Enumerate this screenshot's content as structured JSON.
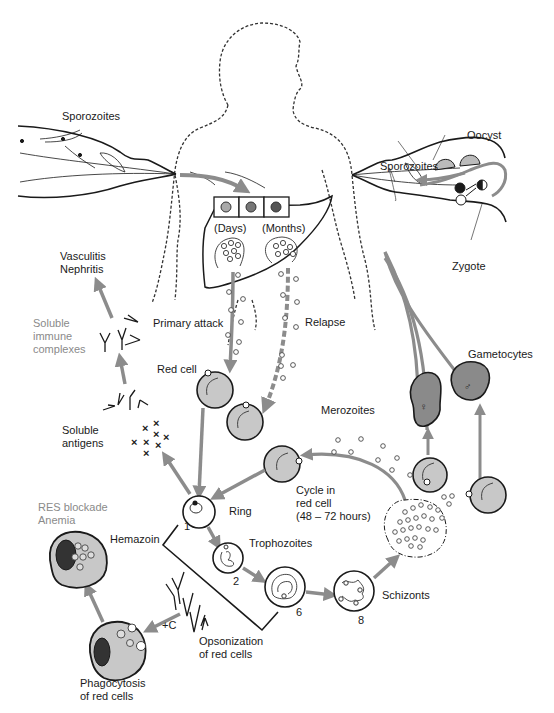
{
  "diagram": {
    "type": "malaria-life-cycle",
    "colors": {
      "arrow": "#8c8c8c",
      "cell_fill": "#c8c8c8",
      "gametocyte_fill": "#8a8a8a",
      "outline": "#1a1a1a",
      "gray_label": "#8a8a8a"
    },
    "labels": {
      "sporozoites_left": "Sporozoites",
      "sporozoites_right": "Sporozoites",
      "oocyst": "Oocyst",
      "zygote": "Zygote",
      "days": "(Days)",
      "months": "(Months)",
      "vasculitis": "Vasculitis\nNephritis",
      "soluble_immune": "Soluble\nimmune\ncomplexes",
      "primary_attack": "Primary attack",
      "relapse": "Relapse",
      "red_cell": "Red cell",
      "gametocytes": "Gametocytes",
      "soluble_antigens": "Soluble\nantigens",
      "merozoites": "Merozoites",
      "cycle": "Cycle in\nred cell\n(48 – 72 hours)",
      "res_blockade": "RES blockade\nAnemia",
      "ring": "Ring",
      "hemazoin": "Hemazoin",
      "trophozoites": "Trophozoites",
      "schizonts": "Schizonts",
      "plus_c": "+C",
      "opsonization": "Opsonization\nof red cells",
      "phagocytosis": "Phagocytosis\nof red cells"
    },
    "stage_numbers": {
      "ring": "1",
      "trophozoite": "2",
      "late_trophozoite": "6",
      "schizont": "8"
    },
    "symbols": {
      "female": "♀",
      "male": "♂"
    }
  }
}
